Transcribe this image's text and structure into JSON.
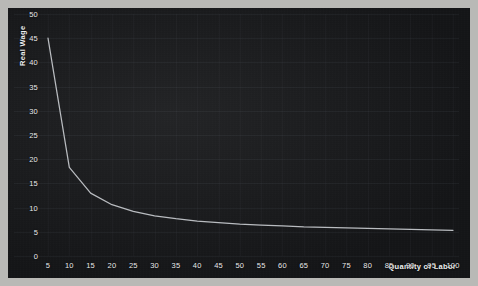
{
  "chart_data": {
    "type": "line",
    "title": "",
    "xlabel": "Quantity of Labor",
    "ylabel": "Real Wage",
    "xlim": [
      5,
      100
    ],
    "ylim": [
      0,
      50
    ],
    "grid": true,
    "legend": null,
    "xticks": [
      5,
      10,
      15,
      20,
      25,
      30,
      35,
      40,
      45,
      50,
      55,
      60,
      65,
      70,
      75,
      80,
      85,
      90,
      95,
      100
    ],
    "yticks": [
      0,
      5,
      10,
      15,
      20,
      25,
      30,
      35,
      40,
      45,
      50
    ],
    "series": [
      {
        "name": "Labor Demand",
        "color": "#b9bcc0",
        "x": [
          5,
          10,
          15,
          20,
          25,
          30,
          35,
          40,
          45,
          50,
          55,
          60,
          65,
          70,
          75,
          80,
          85,
          90,
          95,
          100
        ],
        "values": [
          45.0,
          18.3,
          13.0,
          10.6,
          9.2,
          8.3,
          7.7,
          7.2,
          6.9,
          6.6,
          6.4,
          6.2,
          6.0,
          5.9,
          5.8,
          5.7,
          5.6,
          5.5,
          5.4,
          5.3
        ]
      }
    ]
  },
  "axes": {
    "y_label_text": "Real Wage",
    "x_label_text": "Quantity of Labor"
  }
}
